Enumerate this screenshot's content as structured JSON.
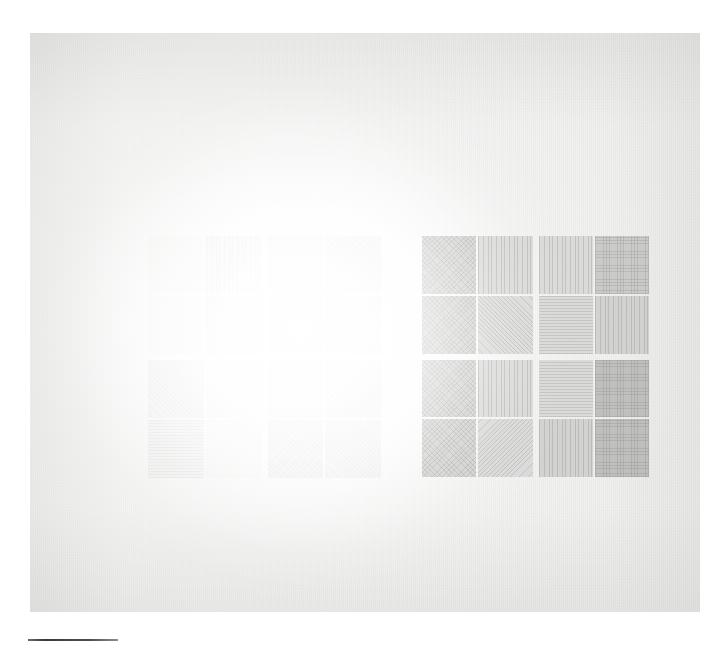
{
  "plate": {
    "kind": "photographic-plate",
    "medium_note": "graphite-on-paper",
    "sheet_color": "#e7e7e5",
    "surround_color": "#ffffff",
    "ink_color": "#929290",
    "rule_color": "#3a3a3a",
    "caption": "",
    "title": ""
  },
  "registration_rule": {
    "label": "",
    "length_px": 90
  },
  "compositions": [
    {
      "id": "left-composition",
      "label": "",
      "opacity_note": "nearly erased",
      "quadrants": [
        {
          "id": "left-q-top-left",
          "cells": [
            {
              "hatch": "h-plain",
              "density": "d0"
            },
            {
              "hatch": "h-vert",
              "density": "d1"
            },
            {
              "hatch": "h-plain",
              "density": "d0"
            },
            {
              "hatch": "h-diag-r",
              "density": "d1"
            }
          ]
        },
        {
          "id": "left-q-top-right",
          "cells": [
            {
              "hatch": "h-diag-l",
              "density": "d1"
            },
            {
              "hatch": "h-chevron",
              "density": "d2"
            },
            {
              "hatch": "h-diag-r",
              "density": "d1"
            },
            {
              "hatch": "h-cross",
              "density": "d2"
            }
          ]
        },
        {
          "id": "left-q-bottom-left",
          "cells": [
            {
              "hatch": "h-diag-r",
              "density": "d1"
            },
            {
              "hatch": "h-plain",
              "density": "d0"
            },
            {
              "hatch": "h-horz",
              "density": "d1"
            },
            {
              "hatch": "h-plain",
              "density": "d0"
            }
          ]
        },
        {
          "id": "left-q-bottom-right",
          "cells": [
            {
              "hatch": "h-diag-l",
              "density": "d1"
            },
            {
              "hatch": "h-chevron",
              "density": "d2"
            },
            {
              "hatch": "h-cross",
              "density": "d2"
            },
            {
              "hatch": "h-diag-r",
              "density": "d2"
            }
          ]
        }
      ]
    },
    {
      "id": "right-composition",
      "label": "",
      "opacity_note": "graphite visible",
      "quadrants": [
        {
          "id": "right-q-top-left",
          "cells": [
            {
              "hatch": "h-cross",
              "density": "d3"
            },
            {
              "hatch": "h-vert",
              "density": "d2"
            },
            {
              "hatch": "h-cross",
              "density": "d3"
            },
            {
              "hatch": "h-diag-r",
              "density": "d2"
            }
          ]
        },
        {
          "id": "right-q-top-right",
          "cells": [
            {
              "hatch": "h-vert",
              "density": "d2"
            },
            {
              "hatch": "h-grid",
              "density": "d4"
            },
            {
              "hatch": "h-horz",
              "density": "d2"
            },
            {
              "hatch": "h-vert",
              "density": "d3"
            }
          ]
        },
        {
          "id": "right-q-bottom-left",
          "cells": [
            {
              "hatch": "h-cross",
              "density": "d3"
            },
            {
              "hatch": "h-vert",
              "density": "d2"
            },
            {
              "hatch": "h-cross",
              "density": "d3"
            },
            {
              "hatch": "h-diag-l",
              "density": "d2"
            }
          ]
        },
        {
          "id": "right-q-bottom-right",
          "cells": [
            {
              "hatch": "h-horz",
              "density": "d2"
            },
            {
              "hatch": "h-grid",
              "density": "d5"
            },
            {
              "hatch": "h-vert",
              "density": "d3"
            },
            {
              "hatch": "h-grid",
              "density": "d5"
            }
          ]
        }
      ]
    }
  ]
}
